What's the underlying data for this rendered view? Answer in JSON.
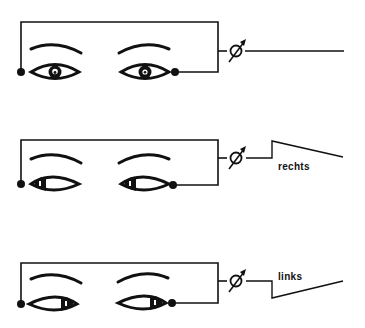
{
  "diagram": {
    "type": "electro-oculography eye-movement illustration",
    "colors": {
      "ink": "#111111",
      "background": "#ffffff"
    },
    "panels": [
      {
        "id": "center",
        "gaze": "straight",
        "trace": "flat",
        "label": ""
      },
      {
        "id": "right",
        "gaze": "right",
        "trace": "step-up then decay",
        "label": "rechts"
      },
      {
        "id": "left",
        "gaze": "left",
        "trace": "step-down then recovery",
        "label": "links"
      }
    ],
    "icons": {
      "meter": "galvanometer-meter-icon",
      "electrode": "electrode-dot-icon",
      "eye": "eye-icon",
      "brow": "eyebrow-icon"
    }
  }
}
